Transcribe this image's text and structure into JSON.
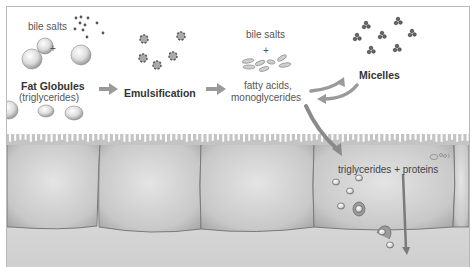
{
  "diagram": {
    "labels": {
      "bile_salts_1": "bile salts",
      "plus_1": "+",
      "fat_globules": "Fat Globules",
      "triglycerides_paren": "(triglycerides)",
      "emulsification": "Emulsification",
      "bile_salts_2": "bile salts",
      "plus_2": "+",
      "fatty_acids": "fatty acids,",
      "monoglycerides": "monoglycerides",
      "micelles": "Micelles",
      "triglycerides_proteins": "triglycerides + proteins"
    },
    "flow": [
      {
        "from": "Fat Globules (triglycerides)",
        "to": "Emulsification"
      },
      {
        "from": "Emulsification",
        "to": "fatty acids, monoglycerides"
      },
      {
        "from": "fatty acids, monoglycerides",
        "to": "Micelles",
        "bidirectional": true
      },
      {
        "from": "fatty acids, monoglycerides",
        "to": "triglycerides + proteins"
      },
      {
        "from": "triglycerides + proteins",
        "to": "lacteal / lymph"
      }
    ],
    "colors": {
      "arrow": "#9a9a9a",
      "cell_fill": "#c9c9c9",
      "cell_edge": "#7a7a7a",
      "text": "#555555",
      "bold_text": "#333333"
    }
  }
}
